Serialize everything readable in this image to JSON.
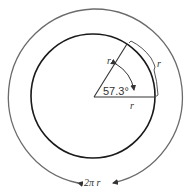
{
  "diagram": {
    "angle_label": "57.3°",
    "radius_label_slant": "r",
    "radius_label_base": "r",
    "arc_label": "r",
    "circumference_label": "2π r",
    "colors": {
      "outer_circle": "#6b6b6b",
      "inner_circle": "#1a1a1a",
      "lines": "#333333",
      "text": "#333333"
    }
  }
}
